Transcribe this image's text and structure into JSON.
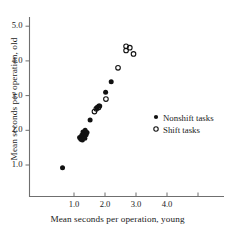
{
  "chart_data": {
    "type": "scatter",
    "title": "",
    "xlabel": "Mean seconds per operation, young",
    "ylabel": "Mean seconds per operation, old",
    "xlim": [
      0.1,
      5.4
    ],
    "ylim": [
      0.15,
      5.45
    ],
    "grid": false,
    "xticks": [
      1.0,
      2.0,
      3.0,
      4.0,
      5.0
    ],
    "xtick_labels": [
      "1.0",
      "2.0",
      "3.0",
      "4.0",
      ""
    ],
    "yticks": [
      1.0,
      2.0,
      3.0,
      4.0,
      5.0
    ],
    "ytick_labels": [
      "1.0",
      "2.0",
      "3.0",
      "4.0",
      "5.0"
    ],
    "legend_position": "center-right",
    "series": [
      {
        "name": "Nonshift tasks",
        "marker": "filled-circle",
        "color": "#111111",
        "points": [
          [
            0.63,
            0.92
          ],
          [
            1.18,
            1.79
          ],
          [
            1.22,
            1.74
          ],
          [
            1.25,
            1.86
          ],
          [
            1.27,
            1.72
          ],
          [
            1.29,
            1.95
          ],
          [
            1.31,
            1.81
          ],
          [
            1.33,
            1.9
          ],
          [
            1.35,
            1.77
          ],
          [
            1.36,
            2.0
          ],
          [
            1.39,
            1.87
          ],
          [
            1.42,
            1.94
          ],
          [
            1.52,
            2.3
          ],
          [
            1.74,
            2.66
          ],
          [
            1.8,
            2.7
          ],
          [
            1.83,
            2.7
          ],
          [
            2.02,
            3.1
          ],
          [
            2.2,
            3.4
          ]
        ]
      },
      {
        "name": "Shift tasks",
        "marker": "open-circle",
        "color": "#111111",
        "points": [
          [
            1.66,
            2.54
          ],
          [
            1.72,
            2.62
          ],
          [
            1.79,
            2.66
          ],
          [
            2.03,
            2.9
          ],
          [
            2.42,
            3.8
          ],
          [
            2.68,
            4.42
          ],
          [
            2.68,
            4.3
          ],
          [
            2.8,
            4.38
          ],
          [
            2.92,
            4.2
          ]
        ]
      }
    ],
    "legend": [
      {
        "label": "Nonshift tasks",
        "marker": "filled-circle"
      },
      {
        "label": "Shift tasks",
        "marker": "open-circle"
      }
    ]
  },
  "axes": {
    "x_title": "Mean seconds per operation, young",
    "y_title": "Mean seconds per operation, old",
    "x_tick_labels": [
      "1.0",
      "2.0",
      "3.0",
      "4.0"
    ],
    "y_tick_labels": [
      "1.0",
      "2.0",
      "3.0",
      "4.0",
      "5.0"
    ]
  },
  "legend": {
    "nonshift_label": "Nonshift tasks",
    "shift_label": "Shift tasks"
  },
  "colors": {
    "marker": "#111111",
    "axis": "#6f6f6f",
    "text": "#1a1a1a",
    "background": "#ffffff"
  }
}
